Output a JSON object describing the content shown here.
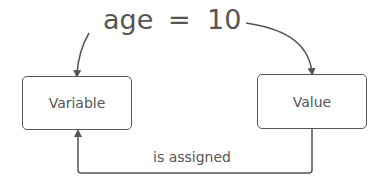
{
  "expression": {
    "variable": "age",
    "operator": "=",
    "value": "10"
  },
  "nodes": {
    "variable_box": "Variable",
    "value_box": "Value"
  },
  "edges": {
    "assignment_label": "is assigned"
  },
  "colors": {
    "stroke": "#555555",
    "text": "#555555",
    "background": "#ffffff"
  }
}
